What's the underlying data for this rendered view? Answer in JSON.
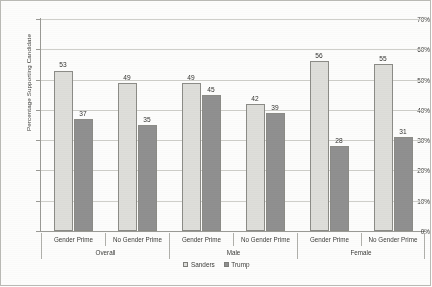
{
  "chart_data": {
    "type": "bar",
    "title": "",
    "xlabel": "",
    "ylabel": "Percentage Supporting Candidate",
    "ylim": [
      0,
      70
    ],
    "ytick_labels": [
      "0%",
      "10%",
      "20%",
      "30%",
      "40%",
      "50%",
      "60%",
      "70%"
    ],
    "ytick_values": [
      0,
      10,
      20,
      30,
      40,
      50,
      60,
      70
    ],
    "grid": true,
    "legend_position": "bottom-center",
    "categories": [
      "Gender Prime",
      "No Gender Prime",
      "Gender Prime",
      "No Gender Prime",
      "Gender Prime",
      "No Gender Prime"
    ],
    "groups": [
      {
        "label": "Overall",
        "span": 2
      },
      {
        "label": "Male",
        "span": 2
      },
      {
        "label": "Female",
        "span": 2
      }
    ],
    "series": [
      {
        "name": "Sanders",
        "color": "#dededa",
        "values": [
          53,
          49,
          49,
          42,
          56,
          55
        ]
      },
      {
        "name": "Trump",
        "color": "#909090",
        "values": [
          37,
          35,
          45,
          39,
          28,
          31
        ]
      }
    ]
  }
}
